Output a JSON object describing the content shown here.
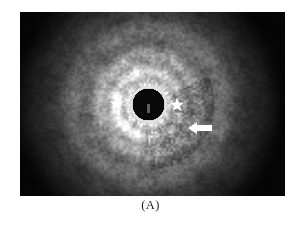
{
  "figure": {
    "caption": "(A)",
    "modality": "endoscopic-ultrasound",
    "background_color": "#ffffff",
    "image_bounds": {
      "x": 20,
      "y": 12,
      "width": 265,
      "height": 184
    }
  },
  "ultrasound": {
    "grayscale": true,
    "corner_color": "#0d0d0d",
    "mid_tissue_color": "#8c8c8c",
    "bright_ring_color": "#d8d8d8",
    "lumen_color": "#050505",
    "lumen": {
      "cx": 128,
      "cy": 92,
      "r": 17,
      "rim_color": "#ececec",
      "rim_width": 2
    },
    "rings": [
      {
        "r": 20,
        "brightness": 0.86
      },
      {
        "r": 26,
        "brightness": 0.62
      },
      {
        "r": 33,
        "brightness": 0.74
      },
      {
        "r": 41,
        "brightness": 0.55
      },
      {
        "r": 50,
        "brightness": 0.66
      },
      {
        "r": 62,
        "brightness": 0.45
      },
      {
        "r": 76,
        "brightness": 0.52
      },
      {
        "r": 92,
        "brightness": 0.33
      },
      {
        "r": 112,
        "brightness": 0.26
      },
      {
        "r": 140,
        "brightness": 0.12
      }
    ]
  },
  "annotations": {
    "stars": [
      {
        "name": "star-marker-left",
        "cx": 97,
        "cy": 92,
        "r": 7.5,
        "color": "#ffffff"
      },
      {
        "name": "star-marker-right",
        "cx": 157,
        "cy": 93,
        "r": 7.5,
        "color": "#ffffff"
      }
    ],
    "arrows": [
      {
        "name": "arrow-marker",
        "tip_x": 168,
        "tip_y": 116,
        "tail_x": 192,
        "tail_y": 116,
        "color": "#ffffff"
      }
    ]
  }
}
